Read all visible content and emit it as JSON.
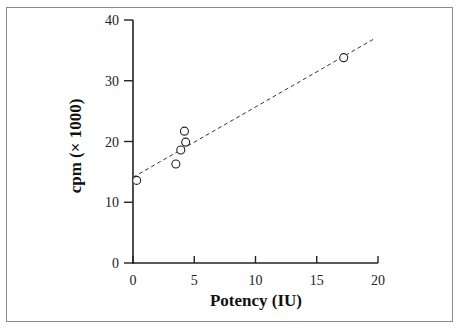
{
  "chart_data": {
    "type": "scatter",
    "title": "",
    "xlabel": "Potency (IU)",
    "ylabel": "cpm (× 1000)",
    "xlim": [
      0,
      20
    ],
    "ylim": [
      0,
      40
    ],
    "x_ticks": [
      0,
      5,
      10,
      15,
      20
    ],
    "y_ticks": [
      0,
      10,
      20,
      30,
      40
    ],
    "grid": false,
    "legend": null,
    "series": [
      {
        "name": "samples",
        "marker": "open-circle",
        "points": [
          {
            "x": 0.3,
            "y": 13.6
          },
          {
            "x": 3.5,
            "y": 16.3
          },
          {
            "x": 3.9,
            "y": 18.6
          },
          {
            "x": 4.3,
            "y": 19.9
          },
          {
            "x": 4.2,
            "y": 21.7
          },
          {
            "x": 17.2,
            "y": 33.8
          }
        ]
      },
      {
        "name": "fit",
        "style": "dashed-line",
        "points": [
          {
            "x": 0,
            "y": 14.1
          },
          {
            "x": 19.6,
            "y": 36.8
          }
        ]
      }
    ]
  },
  "labels": {
    "x_title": "Potency (IU)",
    "y_title": "cpm (× 1000)",
    "x_ticks": [
      "0",
      "5",
      "10",
      "15",
      "20"
    ],
    "y_ticks": [
      "0",
      "10",
      "20",
      "30",
      "40"
    ]
  }
}
